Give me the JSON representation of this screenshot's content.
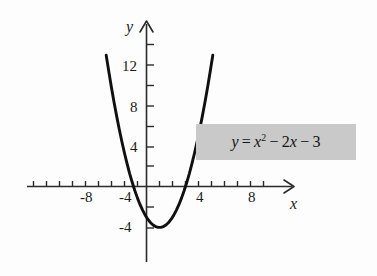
{
  "figure": {
    "background_color": "#fdfdfd",
    "curve_color": "#101010",
    "axis_color": "#2b2b2b",
    "equation_box_color": "#c9c9c9"
  },
  "axes": {
    "x_axis_label": "x",
    "y_axis_label": "y",
    "x_tick_labels": [
      "-8",
      "-4",
      "4",
      "8"
    ],
    "y_tick_labels": [
      "12",
      "8",
      "4",
      "-4"
    ],
    "x_ticks": [
      -9,
      -8,
      -7,
      -6,
      -5,
      -4,
      -3,
      -2,
      -1,
      1,
      2,
      3,
      4,
      5,
      6,
      7,
      8,
      9
    ],
    "y_ticks": [
      -4,
      -2,
      2,
      4,
      6,
      8,
      10,
      12,
      14
    ],
    "x_range": [
      -9.5,
      11.5
    ],
    "y_range": [
      -7,
      16
    ]
  },
  "annotation": {
    "equation_y": "y",
    "equation_equals": "=",
    "equation_x": "x",
    "equation_exponent": "2",
    "equation_minus_1": "−",
    "equation_term_2x_coef": "2",
    "equation_term_2x_var": "x",
    "equation_minus_2": "−",
    "equation_constant": "3",
    "equation_plain": "y = x² − 2x − 3"
  },
  "chart_data": {
    "type": "line",
    "title": "",
    "subtitle": "",
    "xlabel": "x",
    "ylabel": "y",
    "xlim": [
      -9.5,
      11.5
    ],
    "ylim": [
      -7,
      16
    ],
    "grid": false,
    "legend_position": "none",
    "annotations": [
      "y = x² − 2x − 3"
    ],
    "series": [
      {
        "name": "y = x^2 - 2x - 3",
        "equation": "y = x^2 - 2x - 3",
        "color": "#101010",
        "vertex": [
          1,
          -4
        ],
        "x_intercepts": [
          -1,
          3
        ],
        "y_intercept": -3,
        "x": [
          -3.1,
          -2.9,
          -2.7,
          -2.5,
          -2.3,
          -2.1,
          -1.9,
          -1.7,
          -1.5,
          -1.3,
          -1.1,
          -0.9,
          -0.7,
          -0.5,
          -0.3,
          -0.1,
          0.1,
          0.3,
          0.5,
          0.7,
          0.9,
          1.1,
          1.3,
          1.5,
          1.7,
          1.9,
          2.1,
          2.3,
          2.5,
          2.7,
          2.9,
          3.1,
          3.3,
          3.5,
          3.7,
          3.9,
          4.1,
          4.3,
          4.5,
          4.7,
          4.9,
          5.1
        ],
        "y": [
          12.81,
          11.21,
          9.69,
          8.25,
          6.89,
          5.61,
          4.41,
          3.29,
          2.25,
          1.29,
          0.41,
          -0.39,
          -1.11,
          -1.75,
          -2.31,
          -2.79,
          -3.19,
          -3.51,
          -3.75,
          -3.91,
          -3.99,
          -3.99,
          -3.91,
          -3.75,
          -3.51,
          -3.19,
          -2.79,
          -2.31,
          -1.75,
          -1.11,
          -0.39,
          0.41,
          1.29,
          2.25,
          3.29,
          4.41,
          5.61,
          6.89,
          8.25,
          9.69,
          11.21,
          12.81
        ]
      }
    ],
    "x_tick_values": [
      -8,
      -4,
      4,
      8
    ],
    "y_tick_values": [
      12,
      8,
      4,
      -4
    ]
  }
}
